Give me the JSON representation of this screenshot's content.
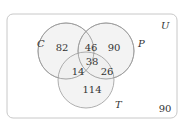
{
  "diagram": {
    "type": "venn",
    "universe_label": "U",
    "sets": [
      {
        "label": "C",
        "cx": 66,
        "cy": 51,
        "r": 28
      },
      {
        "label": "P",
        "cx": 106,
        "cy": 51,
        "r": 28
      },
      {
        "label": "T",
        "cx": 86,
        "cy": 80,
        "r": 28
      }
    ],
    "regions": {
      "C_only": "82",
      "P_only": "90",
      "T_only": "114",
      "C_and_P_only": "46",
      "C_and_T_only": "14",
      "P_and_T_only": "26",
      "C_and_P_and_T": "38",
      "outside": "90"
    },
    "colors": {
      "circle_fill": "#efefef",
      "circle_stroke": "#9a9a9a",
      "border": "#c8c8c8",
      "text": "#333333"
    }
  }
}
